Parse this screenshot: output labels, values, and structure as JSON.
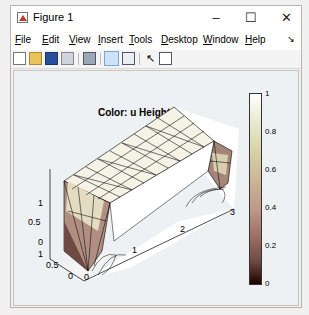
{
  "window": {
    "title": "Figure 1",
    "minimize": "–",
    "maximize": "☐",
    "close": "✕"
  },
  "menubar": {
    "items": [
      {
        "label": "File",
        "accel": "F",
        "rest": "ile"
      },
      {
        "label": "Edit",
        "accel": "E",
        "rest": "dit"
      },
      {
        "label": "View",
        "accel": "V",
        "rest": "iew"
      },
      {
        "label": "Insert",
        "accel": "I",
        "rest": "nsert"
      },
      {
        "label": "Tools",
        "accel": "T",
        "rest": "ools"
      },
      {
        "label": "Desktop",
        "accel": "D",
        "rest": "esktop"
      },
      {
        "label": "Window",
        "accel": "W",
        "rest": "indow"
      },
      {
        "label": "Help",
        "accel": "H",
        "rest": "elp"
      }
    ],
    "dock_arrow": "↘"
  },
  "toolbar": {
    "icons": [
      "new-figure-icon",
      "open-file-icon",
      "save-icon",
      "print-icon",
      "link-plot-icon",
      "hide-plot-tools-icon",
      "show-plot-tools-icon",
      "edit-plot-arrow-icon",
      "insert-colorbar-icon"
    ]
  },
  "plot": {
    "title": "Color: u  Height: u",
    "z_ticks": [
      "1",
      "0.5",
      "0"
    ],
    "y_ticks": [
      "1",
      "0.5",
      "0"
    ],
    "x_ticks": [
      "0",
      "1",
      "2",
      "3"
    ],
    "colormap": "pink"
  },
  "colorbar": {
    "ticks": [
      "1",
      "0.8",
      "0.6",
      "0.4",
      "0.2",
      "0"
    ]
  }
}
